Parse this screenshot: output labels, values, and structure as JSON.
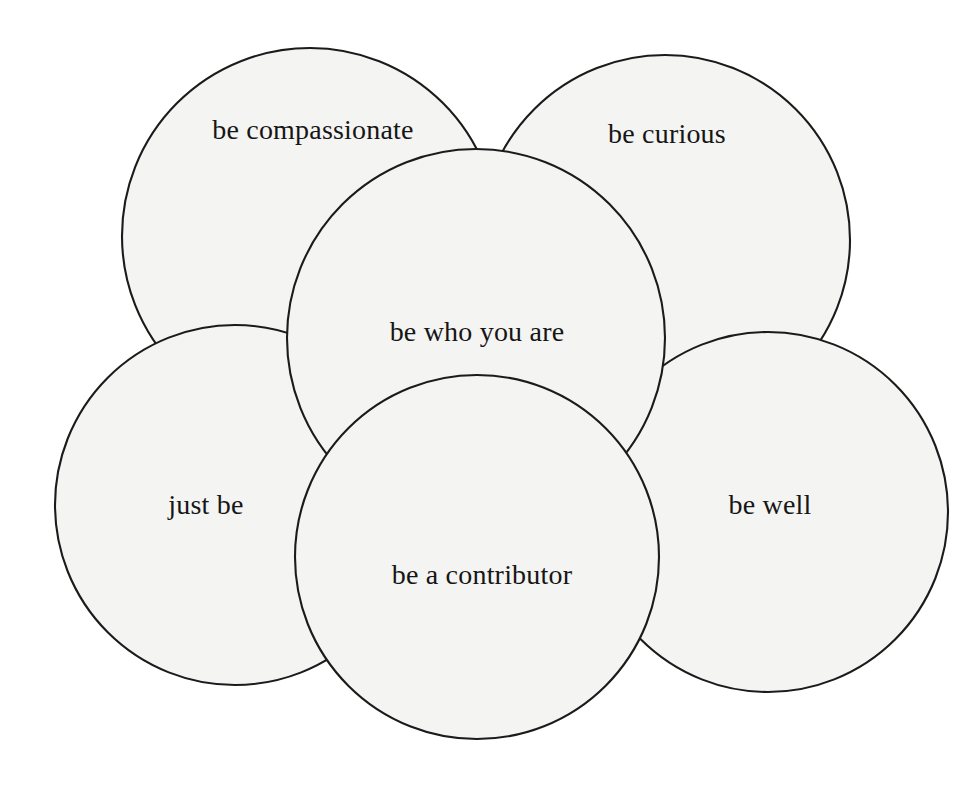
{
  "diagram": {
    "type": "overlapping-circles-venn",
    "title": "be who you are",
    "background_color": "#ffffff",
    "circle_fill_color": "#f4f4f2",
    "circle_stroke_color": "#1b1b1b",
    "text_color": "#161616",
    "circles": [
      {
        "id": "be-compassionate",
        "label": "be compassionate",
        "position": "top-left",
        "cx": 310,
        "cy": 236,
        "r": 188,
        "label_x": 313,
        "label_y": 133,
        "font_size": 28,
        "layer": 1
      },
      {
        "id": "be-curious",
        "label": "be curious",
        "position": "top-right",
        "cx": 665,
        "cy": 240,
        "r": 185,
        "label_x": 667,
        "label_y": 137,
        "font_size": 28,
        "layer": 1
      },
      {
        "id": "just-be",
        "label": "just be",
        "position": "bottom-left",
        "cx": 235,
        "cy": 505,
        "r": 180,
        "label_x": 206,
        "label_y": 508,
        "font_size": 28,
        "layer": 1
      },
      {
        "id": "be-well",
        "label": "be well",
        "position": "bottom-right",
        "cx": 768,
        "cy": 512,
        "r": 180,
        "label_x": 770,
        "label_y": 508,
        "font_size": 28,
        "layer": 1
      },
      {
        "id": "be-who-you-are",
        "label": "be who you are",
        "position": "center",
        "cx": 476,
        "cy": 338,
        "r": 189,
        "label_x": 477,
        "label_y": 335,
        "font_size": 28,
        "layer": 2
      },
      {
        "id": "be-a-contributor",
        "label": "be a contributor",
        "position": "bottom-center",
        "cx": 477,
        "cy": 557,
        "r": 182,
        "label_x": 482,
        "label_y": 578,
        "font_size": 28,
        "layer": 3
      }
    ]
  }
}
